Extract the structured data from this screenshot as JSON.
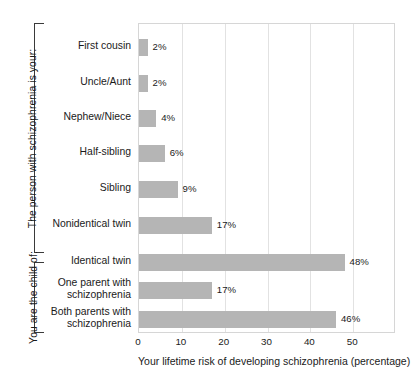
{
  "chart_data": {
    "type": "bar",
    "orientation": "horizontal",
    "title": "",
    "xlabel": "Your lifetime risk of developing schizophrenia (percentage)",
    "ylabel": "",
    "xlim": [
      0,
      60
    ],
    "xticks": [
      0,
      10,
      20,
      30,
      40,
      50
    ],
    "xtick_labels": [
      "0",
      "10",
      "20",
      "30",
      "40",
      "50"
    ],
    "grid": "vertical",
    "legend": "none",
    "bar_color": "#b5b5b5",
    "gridline_color": "#e2e2e2",
    "border_color": "#d6d6d6",
    "categories": [
      "First cousin",
      "Uncle/Aunt",
      "Nephew/Niece",
      "Half-sibling",
      "Sibling",
      "Nonidentical twin",
      "Identical twin",
      "One parent with schizophrenia",
      "Both parents with schizophrenia"
    ],
    "values": [
      2,
      2,
      4,
      6,
      9,
      17,
      48,
      17,
      46
    ],
    "value_labels": [
      "2%",
      "2%",
      "4%",
      "6%",
      "9%",
      "17%",
      "48%",
      "17%",
      "46%"
    ],
    "groups": [
      {
        "label": "The person with schizophrenia is your:",
        "categories": [
          "First cousin",
          "Uncle/Aunt",
          "Nephew/Niece",
          "Half-sibling",
          "Sibling",
          "Nonidentical twin",
          "Identical twin"
        ]
      },
      {
        "label": "You are the child of:",
        "categories": [
          "One parent with schizophrenia",
          "Both parents with schizophrenia"
        ]
      }
    ]
  },
  "groups": [
    {
      "label": "The person with schizophrenia is your:"
    },
    {
      "label": "You are the child of:"
    }
  ],
  "bars": [
    {
      "label_line1": "First cousin",
      "label_line2": "",
      "value_label": "2%"
    },
    {
      "label_line1": "Uncle/Aunt",
      "label_line2": "",
      "value_label": "2%"
    },
    {
      "label_line1": "Nephew/Niece",
      "label_line2": "",
      "value_label": "4%"
    },
    {
      "label_line1": "Half-sibling",
      "label_line2": "",
      "value_label": "6%"
    },
    {
      "label_line1": "Sibling",
      "label_line2": "",
      "value_label": "9%"
    },
    {
      "label_line1": "Nonidentical twin",
      "label_line2": "",
      "value_label": "17%"
    },
    {
      "label_line1": "Identical twin",
      "label_line2": "",
      "value_label": "48%"
    },
    {
      "label_line1": "One parent with",
      "label_line2": "schizophrenia",
      "value_label": "17%"
    },
    {
      "label_line1": "Both parents with",
      "label_line2": "schizophrenia",
      "value_label": "46%"
    }
  ],
  "xaxis": {
    "title": "Your lifetime risk of developing schizophrenia (percentage)",
    "ticks": [
      "0",
      "10",
      "20",
      "30",
      "40",
      "50"
    ]
  }
}
